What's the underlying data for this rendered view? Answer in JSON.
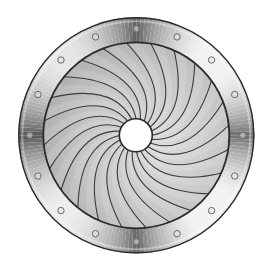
{
  "figure": {
    "title": "Iris diaphragm"
  },
  "geometry": {
    "width": 273,
    "height": 266,
    "center": [
      136.3,
      135.3
    ],
    "outer_ring_radius": 118,
    "inner_ring_radius": 93,
    "aperture_radius": 16.5,
    "bolt_circle_radius": 106.5,
    "bolt_radius": 3.2,
    "bolt_count": 16,
    "bolt_start_angle_deg": -90,
    "blade_count": 24,
    "blade_start_angle_deg": 0,
    "blade_sweep_deg": 52,
    "blade_control_radius": 58,
    "blade_control_offset_deg": 8
  },
  "colors": {
    "background": "#ffffff",
    "outline": "#2a2a2a",
    "blade_line": "#3c3c3c",
    "iris_light": "#dcdcdc",
    "iris_mid": "#c4c4c4",
    "iris_dark": "#a9a9a9",
    "ring_dark": "#5a5a5a",
    "ring_mid": "#9a9a9a",
    "ring_light": "#f2f2f2",
    "aperture": "#ffffff",
    "bolt_stroke": "#6a6a6a",
    "bolt_fill": "#e6e6e6"
  },
  "labels": {
    "ring": "mounting-ring",
    "blades": "iris-blades",
    "aperture": "aperture-opening"
  }
}
